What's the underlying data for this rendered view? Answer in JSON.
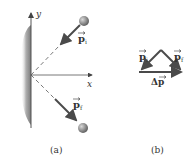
{
  "figure": {
    "panel_a": {
      "caption": "(a)",
      "axis_x_label": "x",
      "axis_y_label": "y",
      "vector_initial_label": "p",
      "vector_initial_sub": "i",
      "vector_final_label": "p",
      "vector_final_sub": "f"
    },
    "panel_b": {
      "caption": "(b)",
      "vector_initial_label": "p",
      "vector_initial_sub": "i",
      "vector_final_label": "p",
      "vector_final_sub": "f",
      "delta_label": "Δp"
    },
    "colors": {
      "wall": "#8a8a8a",
      "arrow": "#4a4a4a",
      "ball": "#8c8c8c",
      "axis": "#555555",
      "text": "#333333"
    }
  }
}
